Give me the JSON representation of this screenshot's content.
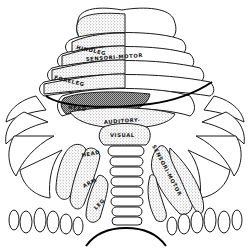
{
  "figure": {
    "colors": {
      "ink": "#1a1a1a",
      "background": "#ffffff",
      "stipple": "#555555"
    }
  },
  "labels": {
    "hindleg": "HINDLEG",
    "sensori_motor_upper": "SENSORI-MOTOR",
    "foreleg": "FORELEG",
    "head_upper": "HEAD",
    "auditory": "AUDITORY-",
    "visual": "VISUAL",
    "head_lower": "HEAD",
    "arm": "ARM",
    "leg": "LEG",
    "sensori_motor_lower": "SENSORI-MOTOR"
  }
}
